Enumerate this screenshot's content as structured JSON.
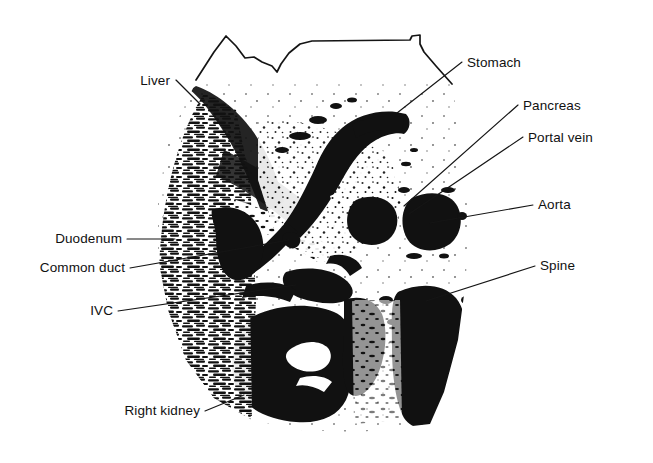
{
  "figure": {
    "kind": "labeled-ultrasound-scan",
    "modality_note": "transverse abdominal ultrasound line drawing",
    "background_color": "#ffffff",
    "ink_color": "#111111",
    "labels": [
      {
        "id": "liver",
        "text": "Liver",
        "text_anchor": "end",
        "text_x": 170,
        "text_y": 85,
        "leader": "M 176,80 L 200,104",
        "side": "left"
      },
      {
        "id": "stomach",
        "text": "Stomach",
        "text_anchor": "start",
        "text_x": 467,
        "text_y": 67,
        "leader": "M 462,62 L 397,113",
        "side": "right"
      },
      {
        "id": "pancreas",
        "text": "Pancreas",
        "text_anchor": "start",
        "text_x": 523,
        "text_y": 110,
        "leader": "M 518,105 L 404,206",
        "side": "right"
      },
      {
        "id": "portal-vein",
        "text": "Portal vein",
        "text_anchor": "start",
        "text_x": 528,
        "text_y": 142,
        "leader": "M 523,137 L 409,214",
        "side": "right"
      },
      {
        "id": "aorta",
        "text": "Aorta",
        "text_anchor": "start",
        "text_x": 538,
        "text_y": 209,
        "leader": "M 533,205 L 430,223",
        "side": "right"
      },
      {
        "id": "spine",
        "text": "Spine",
        "text_anchor": "start",
        "text_x": 540,
        "text_y": 270,
        "leader": "M 535,266 L 426,301",
        "side": "right"
      },
      {
        "id": "duodenum",
        "text": "Duodenum",
        "text_anchor": "end",
        "text_x": 122,
        "text_y": 243,
        "leader": "M 127,239 L 175,239",
        "side": "left"
      },
      {
        "id": "common-duct",
        "text": "Common duct",
        "text_anchor": "end",
        "text_x": 125,
        "text_y": 272,
        "leader": "M 130,268 L 289,240",
        "side": "left"
      },
      {
        "id": "ivc",
        "text": "IVC",
        "text_anchor": "end",
        "text_x": 113,
        "text_y": 315,
        "leader": "M 118,311 L 296,285",
        "side": "left"
      },
      {
        "id": "right-kidney",
        "text": "Right kidney",
        "text_anchor": "end",
        "text_x": 200,
        "text_y": 415,
        "leader": "M 205,411 L 244,395",
        "side": "left"
      }
    ],
    "skin_outline_path": "M 196,80 L 214,52 L 226,36 L 236,46 L 245,58 L 254,57 L 262,62 L 272,66 L 277,72 L 281,64 L 289,53 L 300,44 L 312,41 L 410,40 L 412,36 L 420,35 L 420,44 L 424,52 L 436,66 L 452,84"
  }
}
